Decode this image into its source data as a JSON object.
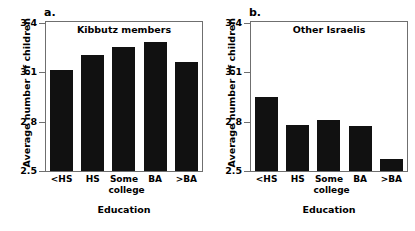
{
  "chart_data": [
    {
      "type": "bar",
      "panel": "a.",
      "title": "Kibbutz members",
      "categories": [
        "<HS",
        "HS",
        "Some college",
        "BA",
        ">BA"
      ],
      "values": [
        3.11,
        3.2,
        3.25,
        3.28,
        3.16
      ],
      "xlabel": "Education",
      "ylabel": "Average number of children",
      "ylim": [
        2.5,
        3.4
      ],
      "yticks": [
        3.4,
        3.1,
        2.8,
        2.5
      ],
      "ytick_labels": [
        "3.4",
        "3.1",
        "2.8",
        "2.5"
      ],
      "grid": false,
      "legend": "none",
      "bar_color": "#111111"
    },
    {
      "type": "bar",
      "panel": "b.",
      "title": "Other Israelis",
      "categories": [
        "<HS",
        "HS",
        "Some college",
        "BA",
        ">BA"
      ],
      "values": [
        2.95,
        2.78,
        2.81,
        2.77,
        2.57
      ],
      "xlabel": "Education",
      "ylabel": "Average number of children",
      "ylim": [
        2.5,
        3.4
      ],
      "yticks": [
        3.4,
        3.1,
        2.8,
        2.5
      ],
      "ytick_labels": [
        "3.4",
        "3.1",
        "2.8",
        "2.5"
      ],
      "grid": false,
      "legend": "none",
      "bar_color": "#111111"
    }
  ],
  "panels": [
    {
      "letter": "a.",
      "title": "Kibbutz members",
      "ylabel": "Average number of children",
      "xlabel": "Education",
      "ytick_labels": [
        "3.4",
        "3.1",
        "2.8",
        "2.5"
      ],
      "xtick_labels": [
        "<HS",
        "HS",
        "Some\ncollege",
        "BA",
        ">BA"
      ],
      "xtick_line1": [
        "<HS",
        "HS",
        "Some",
        "BA",
        ">BA"
      ],
      "xtick_line2": [
        "",
        "",
        "college",
        "",
        ""
      ],
      "bars": [
        {
          "category": "<HS",
          "value": 3.11
        },
        {
          "category": "HS",
          "value": 3.2
        },
        {
          "category": "Some college",
          "value": 3.25
        },
        {
          "category": "BA",
          "value": 3.28
        },
        {
          "category": ">BA",
          "value": 3.16
        }
      ]
    },
    {
      "letter": "b.",
      "title": "Other Israelis",
      "ylabel": "Average number of children",
      "xlabel": "Education",
      "ytick_labels": [
        "3.4",
        "3.1",
        "2.8",
        "2.5"
      ],
      "xtick_labels": [
        "<HS",
        "HS",
        "Some\ncollege",
        "BA",
        ">BA"
      ],
      "xtick_line1": [
        "<HS",
        "HS",
        "Some",
        "BA",
        ">BA"
      ],
      "xtick_line2": [
        "",
        "",
        "college",
        "",
        ""
      ],
      "bars": [
        {
          "category": "<HS",
          "value": 2.95
        },
        {
          "category": "HS",
          "value": 2.78
        },
        {
          "category": "Some college",
          "value": 2.81
        },
        {
          "category": "BA",
          "value": 2.77
        },
        {
          "category": ">BA",
          "value": 2.57
        }
      ]
    }
  ],
  "axis": {
    "y_min": 2.5,
    "y_max": 3.4
  },
  "colors": {
    "bar": "#111111",
    "axis": "#6f6f6f",
    "background": "#ffffff",
    "text": "#000000"
  }
}
